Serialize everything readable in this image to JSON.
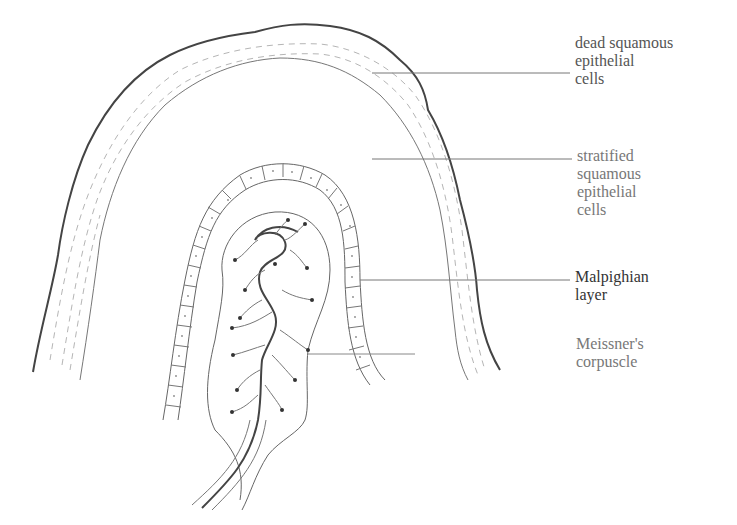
{
  "diagram": {
    "colors": {
      "outline": "#444444",
      "thin_line": "#777777",
      "hatch": "#b0b0b0",
      "text": "#555555"
    },
    "labels": [
      {
        "id": "dead-squamous",
        "lines": [
          "dead squamous",
          "epithelial",
          "cells"
        ],
        "x": 575,
        "y": 34,
        "pointer_from": [
          372,
          73
        ],
        "pointer_to": [
          570,
          73
        ]
      },
      {
        "id": "stratified-squamous",
        "lines": [
          "stratified",
          "squamous",
          "epithelial",
          "cells"
        ],
        "x": 577,
        "y": 147,
        "pointer_from": [
          372,
          159
        ],
        "pointer_to": [
          572,
          159
        ]
      },
      {
        "id": "malpighian-layer",
        "lines": [
          "Malpighian",
          "layer"
        ],
        "x": 575,
        "y": 268,
        "pointer_from": [
          360,
          280
        ],
        "pointer_to": [
          570,
          280
        ]
      },
      {
        "id": "meissners-corpuscle",
        "lines": [
          "Meissner's",
          "corpuscle"
        ],
        "x": 576,
        "y": 335,
        "pointer_from": [
          308,
          354
        ],
        "pointer_to": [
          415,
          354
        ]
      }
    ]
  }
}
